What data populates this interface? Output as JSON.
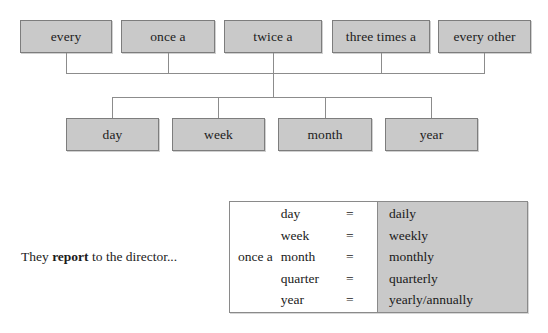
{
  "diagram": {
    "box_fill_color": "#c9c9c9",
    "box_border_color": "#7d7d7d",
    "connector_color": "#8c8c8c",
    "top_row": [
      {
        "label": "every",
        "x": 20,
        "y": 20,
        "w": 92,
        "h": 33
      },
      {
        "label": "once a",
        "x": 121,
        "y": 20,
        "w": 94,
        "h": 33
      },
      {
        "label": "twice a",
        "x": 224,
        "y": 20,
        "w": 98,
        "h": 33
      },
      {
        "label": "three times a",
        "x": 332,
        "y": 20,
        "w": 98,
        "h": 33
      },
      {
        "label": "every other",
        "x": 438,
        "y": 20,
        "w": 93,
        "h": 33
      }
    ],
    "bottom_row": [
      {
        "label": "day",
        "x": 66,
        "y": 118,
        "w": 93,
        "h": 33
      },
      {
        "label": "week",
        "x": 172,
        "y": 118,
        "w": 93,
        "h": 33
      },
      {
        "label": "month",
        "x": 278,
        "y": 118,
        "w": 94,
        "h": 33
      },
      {
        "label": "year",
        "x": 385,
        "y": 118,
        "w": 93,
        "h": 33
      }
    ]
  },
  "example": {
    "sentence_before": "They ",
    "sentence_bold": "report",
    "sentence_after": " to the director...",
    "table": {
      "prefix": "once a",
      "equals_sign": "=",
      "rows": [
        {
          "term": "day",
          "value": "daily"
        },
        {
          "term": "week",
          "value": "weekly"
        },
        {
          "term": "month",
          "value": "monthly"
        },
        {
          "term": "quarter",
          "value": "quarterly"
        },
        {
          "term": "year",
          "value": "yearly/annually"
        }
      ],
      "highlight_color": "#c9c9c9",
      "border_color": "#8a8a8a"
    }
  }
}
